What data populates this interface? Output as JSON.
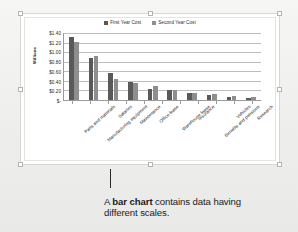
{
  "caption": {
    "prefix": "A ",
    "emphasis": "bar chart",
    "suffix": " contains data having different scales."
  },
  "chart_data": {
    "type": "bar",
    "title": "",
    "xlabel": "",
    "ylabel": "Millions",
    "ylim": [
      0,
      1.4
    ],
    "grid": true,
    "legend_position": "top-center",
    "ytick_labels": [
      "$1.40",
      "$1.20",
      "$1.00",
      "$0.80",
      "$0.60",
      "$0.40",
      "$0.20",
      "$-"
    ],
    "ytick_values": [
      1.4,
      1.2,
      1.0,
      0.8,
      0.6,
      0.4,
      0.2,
      0
    ],
    "categories": [
      "Parts and materials",
      "Manufacturing equipment",
      "Salaries",
      "Maintenance",
      "Office lease",
      "Warehouse lease",
      "Insurance",
      "Benefits and pensions",
      "Vehicles",
      "Research"
    ],
    "series": [
      {
        "name": "First Year Cost",
        "color": "#595959",
        "values": [
          1.31,
          0.88,
          0.56,
          0.38,
          0.24,
          0.21,
          0.14,
          0.1,
          0.07,
          0.04
        ]
      },
      {
        "name": "Second Year Cost",
        "color": "#8e8e8e",
        "values": [
          1.21,
          0.93,
          0.43,
          0.35,
          0.29,
          0.21,
          0.15,
          0.12,
          0.08,
          0.06
        ]
      }
    ]
  },
  "chart_object": {
    "selected": true,
    "handle_count": 8
  }
}
